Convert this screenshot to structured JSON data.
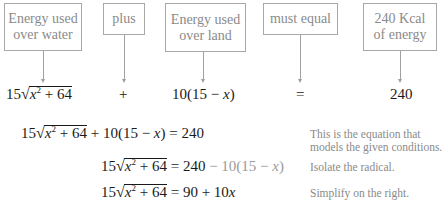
{
  "boxes": [
    {
      "line1": "Energy used",
      "line2": "over water"
    },
    {
      "line1": "plus"
    },
    {
      "line1": "Energy used",
      "line2": "over land"
    },
    {
      "line1": "must equal"
    },
    {
      "line1": "240 Kcal",
      "line2": "of energy"
    }
  ],
  "row_terms": {
    "water_coef": "15",
    "water_radicand_var": "x",
    "water_radicand_exp": "2",
    "water_radicand_rest": " + 64",
    "plus": "+",
    "land": "10(15 − ",
    "land_var": "x",
    "land_close": ")",
    "equals": "=",
    "total": "240"
  },
  "steps": [
    {
      "coef": "15",
      "var": "x",
      "exp": "2",
      "rest": " + 64",
      "rhs": " + 10(15 − ",
      "rhs_var": "x",
      "rhs_tail": ") = 240",
      "note1": "This is the equation that",
      "note2": "models the given conditions."
    },
    {
      "coef": "15",
      "var": "x",
      "exp": "2",
      "rest": " + 64",
      "rhs": " = 240 ",
      "rhs_faded": "− 10(15 − ",
      "rhs_faded_var": "x",
      "rhs_faded_tail": ")",
      "note1": "Isolate the radical."
    },
    {
      "coef": "15",
      "var": "x",
      "exp": "2",
      "rest": " + 64",
      "rhs": " = 90 + 10",
      "rhs_var": "x",
      "note1": "Simplify on the right."
    }
  ]
}
